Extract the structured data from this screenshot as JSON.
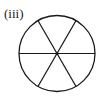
{
  "figure": {
    "label": "(iii)",
    "shape": "circle",
    "sectors": 6,
    "diameters": 3,
    "center_dot": true,
    "stroke_color": "#1a1a1a"
  }
}
